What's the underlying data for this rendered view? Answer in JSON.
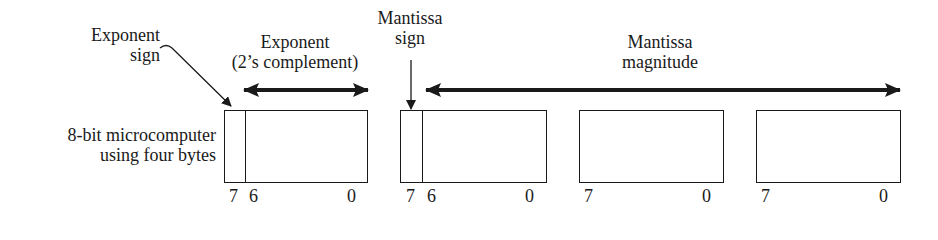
{
  "labels": {
    "exponent_sign": [
      "Exponent",
      "sign"
    ],
    "exponent": [
      "Exponent",
      "(2’s complement)"
    ],
    "mantissa_sign": [
      "Mantissa",
      "sign"
    ],
    "mantissa_magnitude": [
      "Mantissa",
      "magnitude"
    ],
    "row_label": [
      "8-bit microcomputer",
      "using four bytes"
    ]
  },
  "bytes": [
    {
      "role": "exponent",
      "has_sign_bit": true,
      "bits": [
        "7",
        "6",
        "0"
      ]
    },
    {
      "role": "mantissa-high",
      "has_sign_bit": true,
      "bits": [
        "7",
        "6",
        "0"
      ]
    },
    {
      "role": "mantissa-mid",
      "has_sign_bit": false,
      "bits": [
        "7",
        "0"
      ]
    },
    {
      "role": "mantissa-low",
      "has_sign_bit": false,
      "bits": [
        "7",
        "0"
      ]
    }
  ],
  "colors": {
    "ink": "#1a1a1a",
    "background": "#ffffff"
  }
}
